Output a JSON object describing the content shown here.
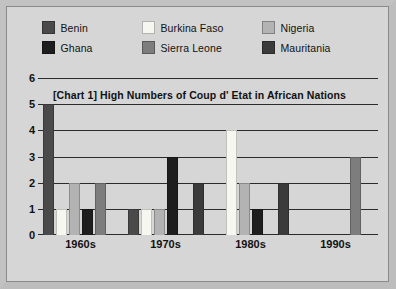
{
  "legend": {
    "rows": [
      [
        {
          "label": "Benin",
          "color": "#4a4a4a",
          "key": "benin"
        },
        {
          "label": "Burkina Faso",
          "color": "#f7f7f2",
          "key": "burkina-faso"
        },
        {
          "label": "Nigeria",
          "color": "#b3b3b3",
          "key": "nigeria"
        }
      ],
      [
        {
          "label": "Ghana",
          "color": "#1e1e1e",
          "key": "ghana"
        },
        {
          "label": "Sierra Leone",
          "color": "#7d7d7d",
          "key": "sierra-leone"
        },
        {
          "label": "Mauritania",
          "color": "#3b3b3b",
          "key": "mauritania"
        }
      ]
    ]
  },
  "chart_data": {
    "type": "bar",
    "title": "[Chart 1]   High Numbers of Coup d' Etat in African Nations",
    "xlabel": "",
    "ylabel": "",
    "categories": [
      "1960s",
      "1970s",
      "1980s",
      "1990s"
    ],
    "yticks": [
      0,
      1,
      2,
      3,
      4,
      5,
      6
    ],
    "ylim": [
      0,
      6
    ],
    "grid": true,
    "legend_position": "top",
    "series": [
      {
        "name": "Benin",
        "color": "#4a4a4a",
        "values": [
          5,
          1,
          0,
          0
        ]
      },
      {
        "name": "Burkina Faso",
        "color": "#f7f7f2",
        "values": [
          1,
          1,
          4,
          0
        ]
      },
      {
        "name": "Nigeria",
        "color": "#b3b3b3",
        "values": [
          2,
          1,
          2,
          0
        ]
      },
      {
        "name": "Ghana",
        "color": "#1e1e1e",
        "values": [
          1,
          3,
          1,
          0
        ]
      },
      {
        "name": "Sierra Leone",
        "color": "#7d7d7d",
        "values": [
          2,
          0,
          0,
          3
        ]
      },
      {
        "name": "Mauritania",
        "color": "#3b3b3b",
        "values": [
          0,
          2,
          2,
          0
        ]
      }
    ]
  }
}
